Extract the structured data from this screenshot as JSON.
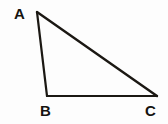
{
  "figure": {
    "kind": "geometry-diagram",
    "shape": "triangle",
    "background_color": "#fdfdfd",
    "stroke_color": "#1b1813",
    "label_color": "#15130f"
  },
  "labels": {
    "a": "A",
    "b": "B",
    "c": "C"
  },
  "chart_data": {
    "type": "scatter",
    "title": "",
    "xlabel": "",
    "ylabel": "",
    "grid": false,
    "legend": "none",
    "xlim": [
      0,
      168
    ],
    "ylim": [
      124,
      0
    ],
    "annotations": [
      "A",
      "B",
      "C"
    ],
    "vertices": [
      {
        "name": "A",
        "x": 37,
        "y": 12,
        "label_x": 20,
        "label_y": 14
      },
      {
        "name": "B",
        "x": 47,
        "y": 96,
        "label_x": 46,
        "label_y": 111
      },
      {
        "name": "C",
        "x": 157,
        "y": 96,
        "label_x": 151,
        "label_y": 111
      }
    ],
    "edges": [
      {
        "name": "AB",
        "from": "A",
        "to": "B",
        "stroke_width": 2.2
      },
      {
        "name": "BC",
        "from": "B",
        "to": "C",
        "stroke_width": 1.9
      },
      {
        "name": "AC",
        "from": "A",
        "to": "C",
        "stroke_width": 2.4
      }
    ],
    "polygon_points": "37,12 47,96 157,96"
  }
}
